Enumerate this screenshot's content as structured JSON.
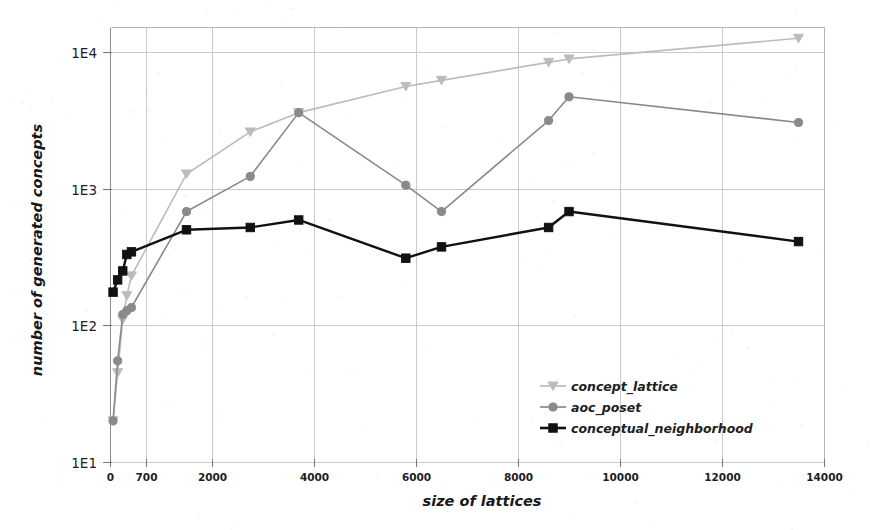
{
  "chart_data": {
    "type": "line",
    "title": "",
    "xlabel": "size of lattices",
    "ylabel": "number of generated concepts",
    "xscale": "linear",
    "yscale": "log",
    "xlim": [
      0,
      14000
    ],
    "ylim": [
      10,
      14000
    ],
    "xticks": [
      0,
      700,
      2000,
      4000,
      6000,
      8000,
      10000,
      12000,
      14000
    ],
    "xtick_labels": [
      "0",
      "700",
      "2000",
      "4000",
      "6000",
      "8000",
      "10000",
      "12000",
      "14000"
    ],
    "yticks": [
      10,
      100,
      1000,
      10000
    ],
    "ytick_labels": [
      "1E1",
      "1E2",
      "1E3",
      "1E4"
    ],
    "grid": true,
    "legend_position": "lower-right",
    "series": [
      {
        "name": "concept_lattice",
        "color": "#bcbcbc",
        "marker": "triangle-down",
        "points": [
          {
            "x": 60,
            "y": 20
          },
          {
            "x": 150,
            "y": 45
          },
          {
            "x": 250,
            "y": 110
          },
          {
            "x": 330,
            "y": 165
          },
          {
            "x": 420,
            "y": 230
          },
          {
            "x": 1500,
            "y": 1280
          },
          {
            "x": 2750,
            "y": 2600
          },
          {
            "x": 3700,
            "y": 3600
          },
          {
            "x": 5800,
            "y": 5600
          },
          {
            "x": 6500,
            "y": 6200
          },
          {
            "x": 8600,
            "y": 8400
          },
          {
            "x": 9000,
            "y": 8900
          },
          {
            "x": 13500,
            "y": 12600
          }
        ]
      },
      {
        "name": "aoc_poset",
        "color": "#8a8a8a",
        "marker": "circle",
        "points": [
          {
            "x": 60,
            "y": 20
          },
          {
            "x": 150,
            "y": 55
          },
          {
            "x": 250,
            "y": 120
          },
          {
            "x": 330,
            "y": 128
          },
          {
            "x": 420,
            "y": 135
          },
          {
            "x": 1500,
            "y": 680
          },
          {
            "x": 2750,
            "y": 1230
          },
          {
            "x": 3700,
            "y": 3600
          },
          {
            "x": 5800,
            "y": 1060
          },
          {
            "x": 6500,
            "y": 680
          },
          {
            "x": 8600,
            "y": 3150
          },
          {
            "x": 9000,
            "y": 4700
          },
          {
            "x": 13500,
            "y": 3050
          }
        ]
      },
      {
        "name": "conceptual_neighborhood",
        "color": "#111111",
        "marker": "square",
        "points": [
          {
            "x": 60,
            "y": 175
          },
          {
            "x": 150,
            "y": 215
          },
          {
            "x": 250,
            "y": 250
          },
          {
            "x": 330,
            "y": 330
          },
          {
            "x": 420,
            "y": 345
          },
          {
            "x": 1500,
            "y": 500
          },
          {
            "x": 2750,
            "y": 520
          },
          {
            "x": 3700,
            "y": 590
          },
          {
            "x": 5800,
            "y": 310
          },
          {
            "x": 6500,
            "y": 375
          },
          {
            "x": 8600,
            "y": 520
          },
          {
            "x": 9000,
            "y": 680
          },
          {
            "x": 13500,
            "y": 410
          }
        ]
      }
    ]
  },
  "legend": {
    "items": [
      {
        "label": "concept_lattice",
        "color": "#bcbcbc",
        "marker": "triangle-down"
      },
      {
        "label": "aoc_poset",
        "color": "#8a8a8a",
        "marker": "circle"
      },
      {
        "label": "conceptual_neighborhood",
        "color": "#111111",
        "marker": "square"
      }
    ]
  }
}
